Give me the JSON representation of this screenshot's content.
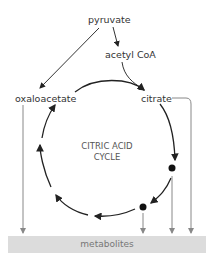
{
  "labels": {
    "pyruvate": "pyruvate",
    "acetyl_coa": "acetyl CoA",
    "oxaloacetate": "oxaloacetate",
    "citrate": "citrate",
    "cycle_line1": "CITRIC ACID",
    "cycle_line2": "CYCLE",
    "metabolites": "metabolites"
  },
  "colors": {
    "cycle_arrow": "#222222",
    "export_arrow": "#888888",
    "metabolites_bar": "#dcdcdc"
  }
}
